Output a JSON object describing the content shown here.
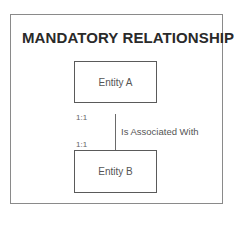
{
  "diagram": {
    "title": "MANDATORY RELATIONSHIP",
    "entities": [
      {
        "label": "Entity A"
      },
      {
        "label": "Entity B"
      }
    ],
    "relationship": {
      "label": "Is Associated With",
      "cardinality_a": "1:1",
      "cardinality_b": "1:1"
    }
  }
}
